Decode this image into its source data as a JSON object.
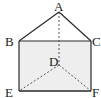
{
  "diagram": {
    "type": "triangular-prism",
    "colors": {
      "stroke": "#2a2a2a",
      "face_fill": "#eeeeee",
      "background": "#ffffff"
    },
    "vertices": {
      "A": {
        "label": "A",
        "x": 59,
        "y": 12
      },
      "B": {
        "label": "B",
        "x": 19,
        "y": 41
      },
      "C": {
        "label": "C",
        "x": 91,
        "y": 41
      },
      "D": {
        "label": "D",
        "x": 59,
        "y": 65
      },
      "E": {
        "label": "E",
        "x": 19,
        "y": 91
      },
      "F": {
        "label": "F",
        "x": 91,
        "y": 91
      }
    },
    "solid_edges": [
      "AB",
      "AC",
      "BC",
      "BE",
      "CF",
      "EF"
    ],
    "dashed_edges": [
      "AD",
      "DE",
      "DF"
    ]
  }
}
